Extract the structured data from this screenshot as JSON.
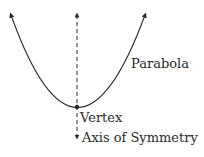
{
  "diagram": {
    "labels": {
      "parabola": "Parabola",
      "vertex": "Vertex",
      "axis": "Axis of Symmetry"
    },
    "colors": {
      "stroke": "#2a2a2a",
      "background": "#ffffff"
    }
  }
}
